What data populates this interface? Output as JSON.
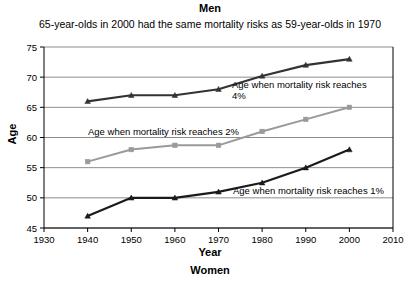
{
  "chart_data": {
    "type": "line",
    "title": "Men",
    "subtitle": "65-year-olds in 2000 had the same mortality risks as 59-year-olds in 1970",
    "footer": "Women",
    "xlabel": "Year",
    "ylabel": "Age",
    "x": [
      1940,
      1950,
      1960,
      1970,
      1980,
      1990,
      2000
    ],
    "xlim": [
      1930,
      2010
    ],
    "ylim": [
      45,
      75
    ],
    "xticks": [
      1930,
      1940,
      1950,
      1960,
      1970,
      1980,
      1990,
      2000,
      2010
    ],
    "yticks": [
      45,
      50,
      55,
      60,
      65,
      70,
      75
    ],
    "grid": true,
    "legend_position": "inline-annotations",
    "series": [
      {
        "name": "Age when mortality risk reaches 4%",
        "color": "#333333",
        "marker": "triangle",
        "values": [
          66.0,
          67.0,
          67.0,
          68.0,
          70.2,
          72.0,
          73.0
        ]
      },
      {
        "name": "Age when mortality risk reaches 2%",
        "color": "#9a9a9a",
        "marker": "square",
        "values": [
          56.0,
          58.0,
          58.7,
          58.7,
          61.0,
          63.0,
          65.0
        ]
      },
      {
        "name": "Age when mortality risk reaches 1%",
        "color": "#1a1a1a",
        "marker": "triangle",
        "values": [
          47.0,
          50.0,
          50.0,
          51.0,
          52.5,
          55.0,
          58.0
        ]
      }
    ],
    "annotations": [
      {
        "id": "annot-4pct",
        "line1": "Age when mortality risk reaches",
        "line2": "4%"
      },
      {
        "id": "annot-2pct",
        "line1": "Age when mortality risk reaches 2%"
      },
      {
        "id": "annot-1pct",
        "line1": "Age when mortality risk reaches 1%"
      }
    ]
  },
  "axes": {
    "x_tick_labels": [
      "1930",
      "1940",
      "1950",
      "1960",
      "1970",
      "1980",
      "1990",
      "2000",
      "2010"
    ],
    "y_tick_labels": [
      "45",
      "50",
      "55",
      "60",
      "65",
      "70",
      "75"
    ]
  }
}
